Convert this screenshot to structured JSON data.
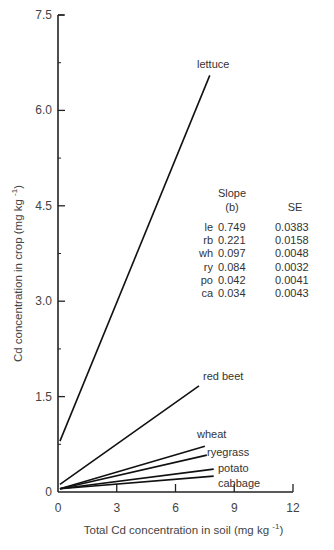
{
  "chart_data": {
    "type": "line",
    "title": "",
    "xlabel": "Total Cd concentration in soil (mg kg -1)",
    "ylabel": "Cd concentration in crop (mg kg -1)",
    "xlim": [
      0,
      12
    ],
    "ylim": [
      0,
      7.5
    ],
    "xticks": [
      "0",
      "3",
      "6",
      "9",
      "12"
    ],
    "yticks": [
      "0",
      "1.5",
      "3.0",
      "4.5",
      "6.0",
      "7.5"
    ],
    "grid": false,
    "legend": "none (direct labels)",
    "series": [
      {
        "name": "lettuce",
        "x": [
          0.1,
          7.75
        ],
        "y": [
          0.8,
          6.55
        ]
      },
      {
        "name": "red beet",
        "x": [
          0.1,
          7.2
        ],
        "y": [
          0.12,
          1.67
        ]
      },
      {
        "name": "wheat",
        "x": [
          0.1,
          7.5
        ],
        "y": [
          0.05,
          0.72
        ]
      },
      {
        "name": "ryegrass",
        "x": [
          0.1,
          7.6
        ],
        "y": [
          0.05,
          0.58
        ]
      },
      {
        "name": "potato",
        "x": [
          0.1,
          7.95
        ],
        "y": [
          0.05,
          0.36
        ]
      },
      {
        "name": "cabbage",
        "x": [
          0.1,
          7.95
        ],
        "y": [
          0.05,
          0.25
        ]
      }
    ],
    "annotation_table": {
      "headers": [
        "",
        "Slope (b)",
        "SE"
      ],
      "header_slope_line1": "Slope",
      "header_slope_line2": "(b)",
      "rows": [
        {
          "crop": "le",
          "slope": "0.749",
          "se": "0.0383"
        },
        {
          "crop": "rb",
          "slope": "0.221",
          "se": "0.0158"
        },
        {
          "crop": "wh",
          "slope": "0.097",
          "se": "0.0048"
        },
        {
          "crop": "ry",
          "slope": "0.084",
          "se": "0.0032"
        },
        {
          "crop": "po",
          "slope": "0.042",
          "se": "0.0041"
        },
        {
          "crop": "ca",
          "slope": "0.034",
          "se": "0.0043"
        }
      ]
    }
  },
  "labels": {
    "xlabel_main": "Total Cd concentration in soil (mg kg",
    "ylabel_main": "Cd concentration in crop (mg kg",
    "unit_sup": "-1",
    "close_paren": ")"
  }
}
